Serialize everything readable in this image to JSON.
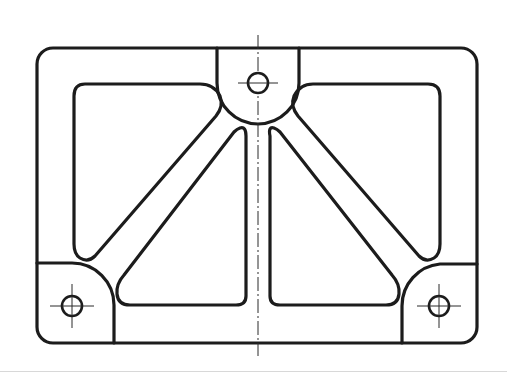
{
  "drawing": {
    "type": "engineering-part-plan-view",
    "description": "Rectangular ribbed frame with three bolt bosses and diagonal ribs",
    "line_color": "#1c1c1c",
    "background": "#ffffff",
    "outer_frame": {
      "x": 37,
      "y": 48,
      "width": 440,
      "height": 295,
      "corner_radius": 16
    },
    "bosses": [
      {
        "name": "top-boss",
        "hole": {
          "cx": 258,
          "cy": 83,
          "r": 10
        },
        "arc_radius": 41
      },
      {
        "name": "bottom-left-boss",
        "hole": {
          "cx": 72,
          "cy": 306,
          "r": 10
        },
        "arc_radius": 42
      },
      {
        "name": "bottom-right-boss",
        "hole": {
          "cx": 439,
          "cy": 306,
          "r": 10
        },
        "arc_radius": 42
      }
    ],
    "center_line_x": 258,
    "center_rib": {
      "left_x": 246,
      "right_x": 270
    },
    "pockets": 4,
    "labels": []
  }
}
